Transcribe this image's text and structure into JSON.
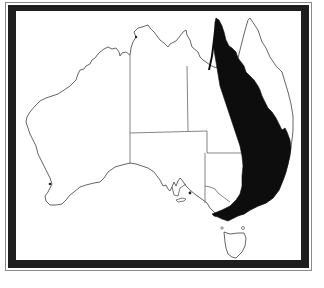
{
  "figure": {
    "type": "distribution-map",
    "region": "Australia",
    "frame": {
      "outer_line_color": "#8a8a8a",
      "band_color": "#1f1f1f",
      "background": "#ffffff"
    },
    "colors": {
      "coastline": "#555555",
      "borders": "#666666",
      "range_fill": "#0d0d0d"
    },
    "features": {
      "mainland": "Australia mainland outline",
      "state_borders": [
        "WA",
        "NT",
        "SA",
        "QLD",
        "NSW",
        "VIC"
      ],
      "island": "Tasmania",
      "shaded_range": "Eastern Australia coastal range from Cape York (QLD) through NSW to Victoria"
    }
  }
}
